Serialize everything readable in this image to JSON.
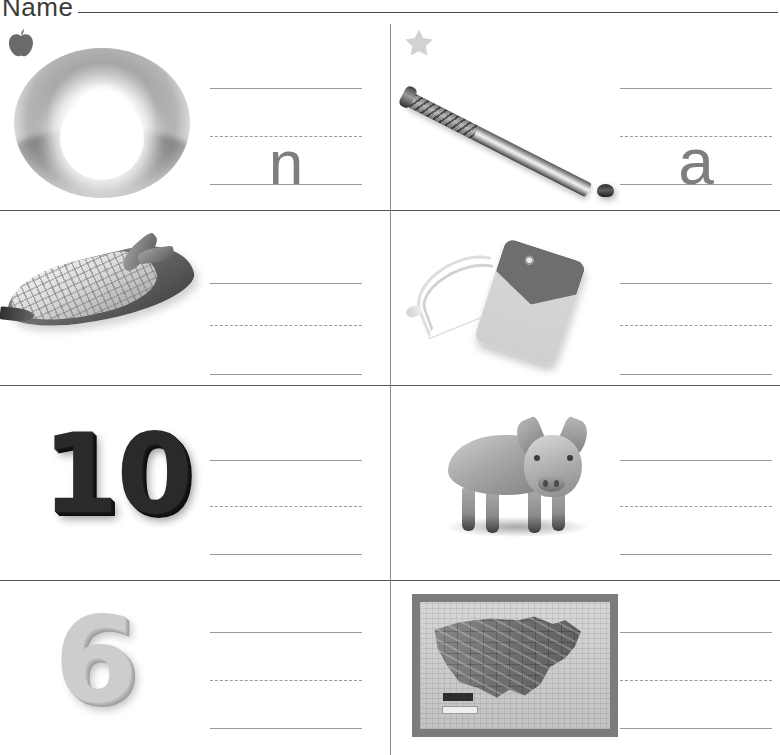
{
  "header": {
    "name_label": "Name",
    "name_value": ""
  },
  "worksheet": {
    "line_colors": {
      "divider": "#545454",
      "vertical_divider": "#8b8b8b",
      "guide_line": "#9a9a9a",
      "trace_letter": "#7e7e7e"
    },
    "guide_line_labels": {
      "top": "top-guide-line",
      "middle": "dashed-midline",
      "bottom": "baseline"
    }
  },
  "cells": [
    {
      "id": "cell-1",
      "marker_icon": "apple-icon",
      "marker_color": "#6a6a6a",
      "picture": "sunrise-photo",
      "picture_alt": "sun rising over horizon",
      "trace_letter": "n",
      "answer": ""
    },
    {
      "id": "cell-2",
      "marker_icon": "star-icon",
      "marker_color": "#d2d2d2",
      "picture": "baseball-bat-photo",
      "picture_alt": "baseball bat",
      "trace_letter": "a",
      "answer": ""
    },
    {
      "id": "cell-3",
      "marker_icon": "",
      "marker_color": "",
      "picture": "corn-photo",
      "picture_alt": "ear of corn",
      "trace_letter": "",
      "answer": ""
    },
    {
      "id": "cell-4",
      "marker_icon": "",
      "marker_color": "",
      "picture": "price-tag-photo",
      "picture_alt": "price tag with string",
      "trace_letter": "",
      "answer": ""
    },
    {
      "id": "cell-5",
      "marker_icon": "",
      "marker_color": "",
      "picture": "numeral-ten-photo",
      "picture_alt": "number 10",
      "numeral": "10",
      "trace_letter": "",
      "answer": ""
    },
    {
      "id": "cell-6",
      "marker_icon": "",
      "marker_color": "",
      "picture": "pig-photo",
      "picture_alt": "pig",
      "trace_letter": "",
      "answer": ""
    },
    {
      "id": "cell-7",
      "marker_icon": "",
      "marker_color": "",
      "picture": "numeral-six-photo",
      "picture_alt": "number 6",
      "numeral": "6",
      "trace_letter": "",
      "answer": ""
    },
    {
      "id": "cell-8",
      "marker_icon": "",
      "marker_color": "",
      "picture": "us-map-photo",
      "picture_alt": "map of the United States",
      "trace_letter": "",
      "answer": ""
    }
  ]
}
